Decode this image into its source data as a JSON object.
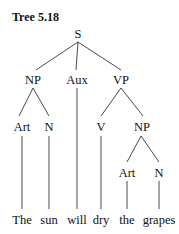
{
  "title": "Tree 5.18",
  "tree": {
    "nodes": [
      {
        "id": "S",
        "label": "S",
        "x": 78,
        "y": 27
      },
      {
        "id": "NP1",
        "label": "NP",
        "x": 32,
        "y": 73
      },
      {
        "id": "Aux",
        "label": "Aux",
        "x": 76,
        "y": 73
      },
      {
        "id": "VP",
        "label": "VP",
        "x": 121,
        "y": 73
      },
      {
        "id": "Art1",
        "label": "Art",
        "x": 22,
        "y": 120
      },
      {
        "id": "N1",
        "label": "N",
        "x": 49,
        "y": 120
      },
      {
        "id": "V",
        "label": "V",
        "x": 101,
        "y": 120
      },
      {
        "id": "NP2",
        "label": "NP",
        "x": 142,
        "y": 120
      },
      {
        "id": "Art2",
        "label": "Art",
        "x": 127,
        "y": 166
      },
      {
        "id": "N2",
        "label": "N",
        "x": 159,
        "y": 166
      }
    ],
    "words": [
      {
        "label": "The",
        "x": 22
      },
      {
        "label": "sun",
        "x": 49
      },
      {
        "label": "will",
        "x": 77
      },
      {
        "label": "dry",
        "x": 101
      },
      {
        "label": "the",
        "x": 127
      },
      {
        "label": "grapes",
        "x": 159
      }
    ]
  }
}
